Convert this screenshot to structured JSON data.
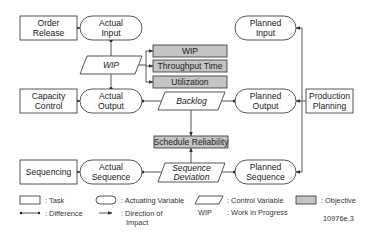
{
  "tasks": {
    "order_release": [
      "Order",
      "Release"
    ],
    "capacity_control": [
      "Capacity",
      "Control"
    ],
    "sequencing": [
      "Sequencing"
    ],
    "production_planning": [
      "Production",
      "Planning"
    ]
  },
  "actuating_variables": {
    "actual_input": [
      "Actual",
      "Input"
    ],
    "actual_output": [
      "Actual",
      "Output"
    ],
    "actual_sequence": [
      "Actual",
      "Sequence"
    ],
    "planned_input": [
      "Planned",
      "Input"
    ],
    "planned_output": [
      "Planned",
      "Output"
    ],
    "planned_sequence": [
      "Planned",
      "Sequence"
    ]
  },
  "control_variables": {
    "wip": "WIP",
    "backlog": "Backlog",
    "sequence_deviation": [
      "Sequence",
      "Deviation"
    ]
  },
  "objectives": {
    "wip": "WIP",
    "throughput_time": "Throughput Time",
    "utilization": "Utilization",
    "schedule_reliability": "Schedule Reliability"
  },
  "legend": {
    "task": ": Task",
    "actuating_variable": ": Actuating Variable",
    "control_variable": ": Control Variable",
    "objective": ": Objective",
    "difference": ": Difference",
    "direction_of_impact": [
      ": Direction of",
      "Impact"
    ],
    "abbrev": "WIP",
    "abbrev_meaning": ": Work in Progress"
  },
  "figure_id": "10976e.3",
  "colors": {
    "objective_fill": "#c4c4c4",
    "stroke": "#444444"
  }
}
